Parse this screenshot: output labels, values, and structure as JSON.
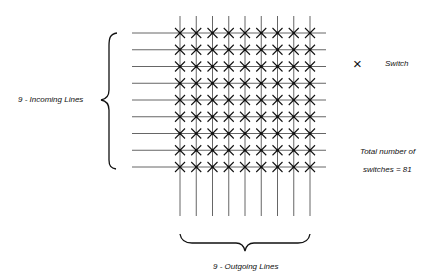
{
  "diagram": {
    "type": "crossbar switch",
    "incoming_lines": 9,
    "outgoing_lines": 9,
    "incoming_label": "9 - Incoming  Lines",
    "outgoing_label": "9 - Outgoing  Lines",
    "legend": {
      "symbol": "×",
      "label": "Switch"
    },
    "total_line1": "Total  number of",
    "total_line2": "switches  =  81"
  }
}
